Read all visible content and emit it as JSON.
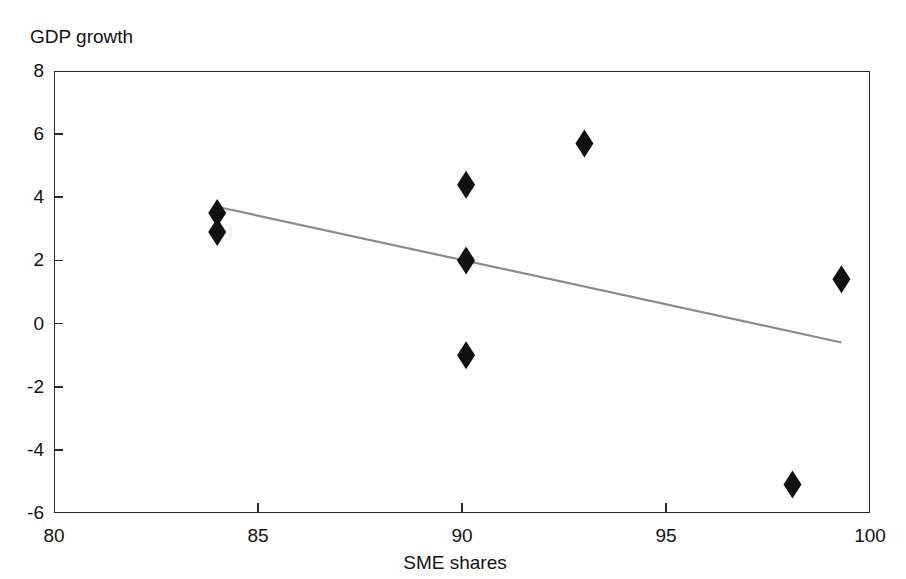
{
  "chart_data": {
    "type": "scatter",
    "title": "",
    "xlabel": "SME shares",
    "ylabel": "GDP growth",
    "xlim": [
      80,
      100
    ],
    "ylim": [
      -6,
      8
    ],
    "xticks": [
      80,
      85,
      90,
      95,
      100
    ],
    "yticks": [
      8,
      6,
      4,
      2,
      0,
      -2,
      -4,
      -6
    ],
    "grid": false,
    "legend": null,
    "marker": "diamond",
    "marker_color": "#111111",
    "points": [
      {
        "x": 84.0,
        "y": 3.5
      },
      {
        "x": 84.0,
        "y": 2.9
      },
      {
        "x": 90.1,
        "y": 4.4
      },
      {
        "x": 90.1,
        "y": 2.0
      },
      {
        "x": 90.1,
        "y": -1.0
      },
      {
        "x": 93.0,
        "y": 5.7
      },
      {
        "x": 98.1,
        "y": -5.1
      },
      {
        "x": 99.3,
        "y": 1.4
      }
    ],
    "trendline": {
      "type": "linear-fit",
      "color": "#8a8a8a",
      "x_start": 84.0,
      "y_start": 3.7,
      "x_end": 99.3,
      "y_end": -0.6
    }
  },
  "axes": {
    "y_label_text": "GDP growth",
    "x_label_text": "SME shares",
    "y_tick_labels": [
      "8",
      "6",
      "4",
      "2",
      "0",
      "-2",
      "-4",
      "-6"
    ],
    "x_tick_labels": [
      "80",
      "85",
      "90",
      "95",
      "100"
    ]
  },
  "style": {
    "background": "#ffffff",
    "axis_color": "#2b2b2b",
    "text_color": "#111111"
  }
}
